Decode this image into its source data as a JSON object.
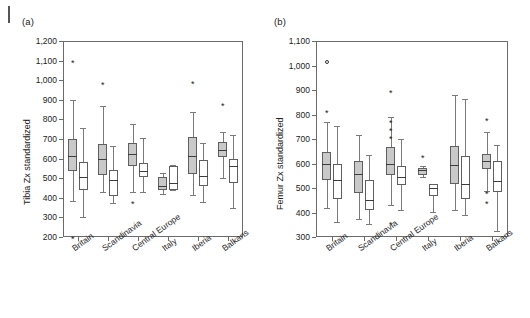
{
  "figure": {
    "panels": [
      {
        "key": "a",
        "label": "(a)"
      },
      {
        "key": "b",
        "label": "(b)"
      }
    ]
  },
  "chart_data": [
    {
      "type": "box",
      "panel": "(a)",
      "title": "",
      "xlabel": "",
      "ylabel": "Tibia Zx standardized",
      "ylim": [
        200,
        1200
      ],
      "yticks": [
        200,
        300,
        400,
        500,
        600,
        700,
        800,
        900,
        1000,
        1100,
        1200
      ],
      "ytick_labels": [
        "200",
        "300",
        "400",
        "500",
        "600",
        "700",
        "800",
        "900",
        "1,000",
        "1,100",
        "1,200"
      ],
      "grid": false,
      "legend": "none",
      "categories": [
        "Britain",
        "Scandinavia",
        "Central Europe",
        "Italy",
        "Iberia",
        "Balkans"
      ],
      "series": [
        {
          "name": "shaded",
          "fill": "#c9c9c9",
          "boxes": [
            {
              "category": "Britain",
              "whisker_low": 385,
              "q1": 538,
              "median": 613,
              "q3": 700,
              "whisker_high": 898,
              "outliers": [
                1105,
                205
              ]
            },
            {
              "category": "Scandinavia",
              "whisker_low": 430,
              "q1": 518,
              "median": 600,
              "q3": 672,
              "whisker_high": 870,
              "outliers": [
                990
              ]
            },
            {
              "category": "Central Europe",
              "whisker_low": 430,
              "q1": 562,
              "median": 622,
              "q3": 678,
              "whisker_high": 778,
              "outliers": [
                383
              ]
            },
            {
              "category": "Italy",
              "whisker_low": 420,
              "q1": 438,
              "median": 462,
              "q3": 505,
              "whisker_high": 525,
              "outliers": []
            },
            {
              "category": "Iberia",
              "whisker_low": 415,
              "q1": 522,
              "median": 613,
              "q3": 708,
              "whisker_high": 838,
              "outliers": [
                998
              ]
            },
            {
              "category": "Balkans",
              "whisker_low": 502,
              "q1": 610,
              "median": 643,
              "q3": 683,
              "whisker_high": 735,
              "outliers": [
                885
              ]
            }
          ]
        },
        {
          "name": "open",
          "fill": "#ffffff",
          "boxes": [
            {
              "category": "Britain",
              "whisker_low": 300,
              "q1": 440,
              "median": 508,
              "q3": 582,
              "whisker_high": 755,
              "outliers": []
            },
            {
              "category": "Scandinavia",
              "whisker_low": 375,
              "q1": 408,
              "median": 493,
              "q3": 542,
              "whisker_high": 662,
              "outliers": []
            },
            {
              "category": "Central Europe",
              "whisker_low": 432,
              "q1": 505,
              "median": 535,
              "q3": 578,
              "whisker_high": 705,
              "outliers": []
            },
            {
              "category": "Italy",
              "whisker_low": 438,
              "q1": 442,
              "median": 475,
              "q3": 562,
              "whisker_high": 568,
              "outliers": []
            },
            {
              "category": "Iberia",
              "whisker_low": 380,
              "q1": 462,
              "median": 512,
              "q3": 592,
              "whisker_high": 682,
              "outliers": []
            },
            {
              "category": "Balkans",
              "whisker_low": 350,
              "q1": 478,
              "median": 562,
              "q3": 598,
              "whisker_high": 722,
              "outliers": []
            }
          ]
        }
      ],
      "annotations": [
        {
          "symbol": "*",
          "category": "Britain",
          "value": 1105
        },
        {
          "symbol": "*",
          "category": "Britain",
          "value": 205
        },
        {
          "symbol": "*",
          "category": "Scandinavia",
          "value": 990
        },
        {
          "symbol": "*",
          "category": "Central Europe",
          "value": 383
        },
        {
          "symbol": "*",
          "category": "Iberia",
          "value": 998
        },
        {
          "symbol": "*",
          "category": "Balkans",
          "value": 885
        }
      ]
    },
    {
      "type": "box",
      "panel": "(b)",
      "title": "",
      "xlabel": "",
      "ylabel": "Femur Zx standardized",
      "ylim": [
        300,
        1100
      ],
      "yticks": [
        300,
        400,
        500,
        600,
        700,
        800,
        900,
        1000,
        1100
      ],
      "ytick_labels": [
        "300",
        "400",
        "500",
        "600",
        "700",
        "800",
        "900",
        "1,000",
        "1,100"
      ],
      "grid": false,
      "legend": "none",
      "categories": [
        "Britain",
        "Scandinavia",
        "Central Europe",
        "Italy",
        "Iberia",
        "Balkans"
      ],
      "series": [
        {
          "name": "shaded",
          "fill": "#c9c9c9",
          "boxes": [
            {
              "category": "Britain",
              "whisker_low": 420,
              "q1": 532,
              "median": 600,
              "q3": 645,
              "whisker_high": 770,
              "outliers": [
                820,
                1015
              ]
            },
            {
              "category": "Scandinavia",
              "whisker_low": 372,
              "q1": 480,
              "median": 558,
              "q3": 612,
              "whisker_high": 718,
              "outliers": []
            },
            {
              "category": "Central Europe",
              "whisker_low": 430,
              "q1": 552,
              "median": 600,
              "q3": 668,
              "whisker_high": 790,
              "outliers": [
                900,
                778,
                745,
                712,
                360
              ]
            },
            {
              "category": "Italy",
              "whisker_low": 545,
              "q1": 555,
              "median": 572,
              "q3": 582,
              "whisker_high": 588,
              "outliers": [
                635
              ]
            },
            {
              "category": "Iberia",
              "whisker_low": 410,
              "q1": 515,
              "median": 595,
              "q3": 672,
              "whisker_high": 880,
              "outliers": []
            },
            {
              "category": "Balkans",
              "whisker_low": 488,
              "q1": 578,
              "median": 612,
              "q3": 640,
              "whisker_high": 728,
              "outliers": [
                785,
                487,
                445
              ]
            }
          ]
        },
        {
          "name": "open",
          "fill": "#ffffff",
          "boxes": [
            {
              "category": "Britain",
              "whisker_low": 360,
              "q1": 455,
              "median": 532,
              "q3": 598,
              "whisker_high": 755,
              "outliers": []
            },
            {
              "category": "Scandinavia",
              "whisker_low": 355,
              "q1": 412,
              "median": 450,
              "q3": 532,
              "whisker_high": 635,
              "outliers": []
            },
            {
              "category": "Central Europe",
              "whisker_low": 412,
              "q1": 512,
              "median": 545,
              "q3": 588,
              "whisker_high": 700,
              "outliers": []
            },
            {
              "category": "Italy",
              "whisker_low": 402,
              "q1": 468,
              "median": 500,
              "q3": 515,
              "whisker_high": 518,
              "outliers": []
            },
            {
              "category": "Iberia",
              "whisker_low": 388,
              "q1": 455,
              "median": 518,
              "q3": 632,
              "whisker_high": 862,
              "outliers": []
            },
            {
              "category": "Balkans",
              "whisker_low": 325,
              "q1": 485,
              "median": 530,
              "q3": 610,
              "whisker_high": 675,
              "outliers": []
            }
          ]
        }
      ],
      "annotations": [
        {
          "symbol": "o",
          "category": "Britain",
          "value": 1015
        },
        {
          "symbol": "*",
          "category": "Britain",
          "value": 820
        },
        {
          "symbol": "*",
          "category": "Central Europe",
          "value": 900
        },
        {
          "symbol": "*",
          "category": "Central Europe",
          "value": 778
        },
        {
          "symbol": "*",
          "category": "Central Europe",
          "value": 745
        },
        {
          "symbol": "*",
          "category": "Central Europe",
          "value": 712
        },
        {
          "symbol": "*",
          "category": "Central Europe",
          "value": 360
        },
        {
          "symbol": "*",
          "category": "Italy",
          "value": 635
        },
        {
          "symbol": "*",
          "category": "Balkans",
          "value": 785
        },
        {
          "symbol": "*",
          "category": "Balkans",
          "value": 487
        },
        {
          "symbol": "*",
          "category": "Balkans",
          "value": 445
        }
      ]
    }
  ]
}
